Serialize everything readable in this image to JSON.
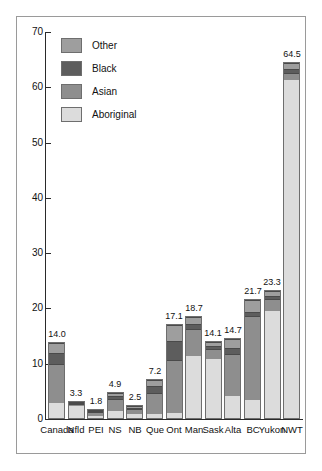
{
  "chart_data": {
    "type": "bar",
    "subtype": "stacked-bar",
    "title": "",
    "xlabel": "",
    "ylabel": "",
    "ylim": [
      0,
      70
    ],
    "yticks": [
      0,
      10,
      20,
      30,
      40,
      50,
      60,
      70
    ],
    "ytick_labels": [
      "0",
      "10",
      "20",
      "30",
      "40",
      "50",
      "60",
      "70"
    ],
    "grid": false,
    "legend_position": "upper-left",
    "categories": [
      "Canada",
      "Nfld",
      "PEI",
      "NS",
      "NB",
      "Que",
      "Ont",
      "Man",
      "Sask",
      "Alta",
      "BC",
      "Yukon",
      "NWT"
    ],
    "totals": [
      14.0,
      3.3,
      1.8,
      4.9,
      2.5,
      7.2,
      17.1,
      18.7,
      14.1,
      14.7,
      21.7,
      23.3,
      64.5
    ],
    "total_labels": [
      "14.0",
      "3.3",
      "1.8",
      "4.9",
      "2.5",
      "7.2",
      "17.1",
      "18.7",
      "14.1",
      "14.7",
      "21.7",
      "23.3",
      "64.5"
    ],
    "series": [
      {
        "name": "Aboriginal",
        "color": "#dcdcdc",
        "values": [
          2.8,
          2.6,
          0.6,
          1.3,
          1.0,
          0.8,
          0.9,
          11.4,
          11.0,
          4.0,
          3.4,
          19.7,
          61.5
        ]
      },
      {
        "name": "Asian",
        "color": "#8e8e8e",
        "values": [
          7.2,
          0.3,
          0.8,
          2.4,
          0.9,
          4.0,
          9.9,
          5.1,
          1.8,
          7.9,
          15.3,
          2.2,
          1.3
        ]
      },
      {
        "name": "Black",
        "color": "#5d5d5d",
        "values": [
          2.0,
          0.2,
          0.2,
          0.7,
          0.3,
          1.3,
          3.4,
          0.9,
          0.5,
          1.1,
          0.8,
          0.5,
          0.7
        ]
      },
      {
        "name": "Other",
        "color": "#9e9e9e",
        "values": [
          2.0,
          0.2,
          0.2,
          0.5,
          0.3,
          1.1,
          2.9,
          1.3,
          0.8,
          1.7,
          2.2,
          0.9,
          1.0
        ]
      }
    ],
    "legend": [
      {
        "label": "Other",
        "color": "#9e9e9e"
      },
      {
        "label": "Black",
        "color": "#5d5d5d"
      },
      {
        "label": "Asian",
        "color": "#8e8e8e"
      },
      {
        "label": "Aboriginal",
        "color": "#dcdcdc"
      }
    ]
  },
  "colors": {
    "frame": "#9a9a9a",
    "axis": "#2a2a2a",
    "text": "#111111",
    "background": "#ffffff"
  }
}
